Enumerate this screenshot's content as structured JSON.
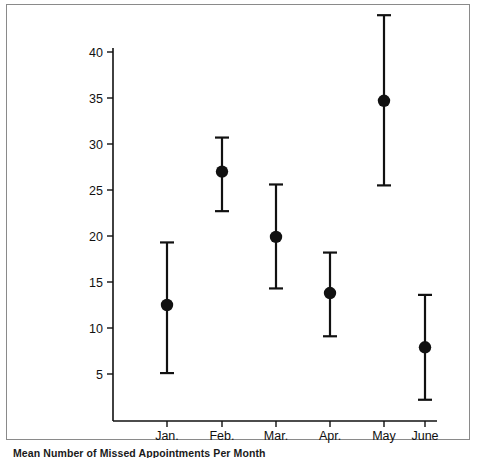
{
  "caption": {
    "text": "Mean Number of Missed Appointments Per Month"
  },
  "colors": {
    "ink": "#111111",
    "frame": "#8a8a8a",
    "background": "#ffffff"
  },
  "chart_data": {
    "type": "scatter",
    "title": "",
    "subtitle": "",
    "xlabel": "",
    "ylabel": "",
    "categories": [
      "Jan.",
      "Feb.",
      "Mar.",
      "Apr.",
      "May",
      "June"
    ],
    "values": [
      12.5,
      27.0,
      19.9,
      13.8,
      34.7,
      7.9
    ],
    "error_upper": [
      19.3,
      30.7,
      25.6,
      18.2,
      44.0,
      13.6
    ],
    "error_lower": [
      5.1,
      22.7,
      14.3,
      9.1,
      25.5,
      2.2
    ],
    "series": [
      {
        "name": "Mean missed appointments",
        "values": [
          12.5,
          27.0,
          19.9,
          13.8,
          34.7,
          7.9
        ]
      }
    ],
    "points": [
      {
        "category": "Jan.",
        "mean": 12.5,
        "upper": 19.3,
        "lower": 5.1
      },
      {
        "category": "Feb.",
        "mean": 27.0,
        "upper": 30.7,
        "lower": 22.7
      },
      {
        "category": "Mar.",
        "mean": 19.9,
        "upper": 25.6,
        "lower": 14.3
      },
      {
        "category": "Apr.",
        "mean": 13.8,
        "upper": 18.2,
        "lower": 9.1
      },
      {
        "category": "May",
        "mean": 34.7,
        "upper": 44.0,
        "lower": 25.5
      },
      {
        "category": "June",
        "mean": 7.9,
        "upper": 13.6,
        "lower": 2.2
      }
    ],
    "yticks": [
      5,
      10,
      15,
      20,
      25,
      30,
      35,
      40
    ],
    "ytick_labels": [
      "5",
      "10",
      "15",
      "20",
      "25",
      "30",
      "35",
      "40"
    ],
    "ylim": [
      0,
      41.5
    ],
    "grid": false,
    "legend": null,
    "marker": "filled-circle",
    "errorbar_style": "capped"
  }
}
